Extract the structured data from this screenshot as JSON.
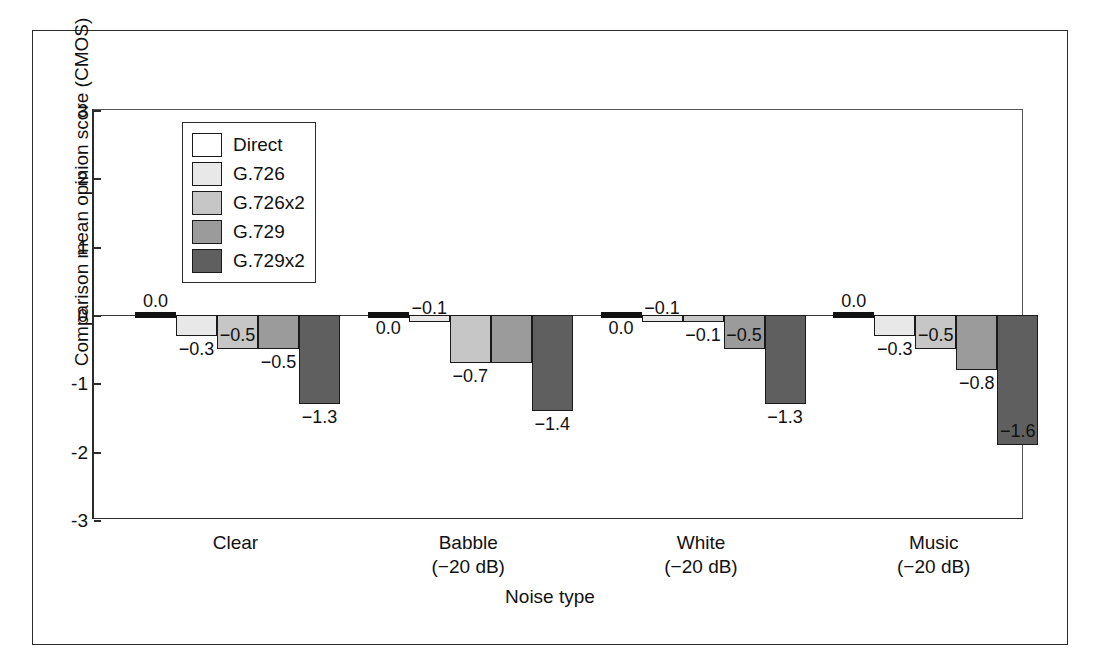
{
  "chart_data": {
    "type": "bar",
    "title": "",
    "xlabel": "Noise type",
    "ylabel": "Comparison mean opinion score (CMOS)",
    "ylim": [
      -3,
      3
    ],
    "yticks": [
      "3",
      "2",
      "1",
      "0",
      "-1",
      "-2",
      "-3"
    ],
    "ytick_values": [
      3,
      2,
      1,
      0,
      -1,
      -2,
      -3
    ],
    "grid": false,
    "legend_position": "upper-left-inside",
    "categories": [
      "Clear",
      "Babble\n(−20 dB)",
      "White\n(−20 dB)",
      "Music\n(−20 dB)"
    ],
    "category_labels": [
      {
        "line1": "Clear",
        "line2": ""
      },
      {
        "line1": "Babble",
        "line2": "(−20 dB)"
      },
      {
        "line1": "White",
        "line2": "(−20 dB)"
      },
      {
        "line1": "Music",
        "line2": "(−20 dB)"
      }
    ],
    "series": [
      {
        "name": "Direct",
        "color": "#ffffff",
        "values": [
          0.0,
          0.0,
          0.0,
          0.0
        ],
        "labels": [
          "0.0",
          "0.0",
          "0.0",
          "0.0"
        ]
      },
      {
        "name": "G.726",
        "color": "#e8e8e8",
        "values": [
          -0.3,
          -0.1,
          -0.1,
          -0.3
        ],
        "labels": [
          "−0.3",
          "−0.1",
          "−0.1",
          "−0.3"
        ]
      },
      {
        "name": "G.726x2",
        "color": "#c6c6c6",
        "values": [
          -0.5,
          -0.7,
          -0.1,
          -0.5
        ],
        "labels": [
          "−0.5",
          "−0.7",
          "−0.1",
          "−0.5"
        ]
      },
      {
        "name": "G.729",
        "color": "#9b9b9b",
        "values": [
          -0.5,
          -0.7,
          -0.5,
          -0.8
        ],
        "labels": [
          "−0.5",
          "−0.7",
          "−0.5",
          "−0.8"
        ]
      },
      {
        "name": "G.729x2",
        "color": "#5f5f5f",
        "values": [
          -1.3,
          -1.4,
          -1.3,
          -1.9
        ],
        "labels": [
          "−1.3",
          "−1.4",
          "−1.3",
          "−1.6"
        ]
      }
    ]
  },
  "legend": {
    "items": [
      {
        "label": "Direct",
        "color": "#ffffff"
      },
      {
        "label": "G.726",
        "color": "#e8e8e8"
      },
      {
        "label": "G.726x2",
        "color": "#c6c6c6"
      },
      {
        "label": "G.729",
        "color": "#9b9b9b"
      },
      {
        "label": "G.729x2",
        "color": "#5f5f5f"
      }
    ]
  },
  "value_label_layout": [
    [
      {
        "text": "0.0",
        "group": 0,
        "bar": 0,
        "pos": "above"
      },
      {
        "text": "−0.3",
        "group": 0,
        "bar": 1,
        "pos": "below"
      },
      {
        "text": "−0.5",
        "group": 0,
        "bar": 2,
        "pos": "above"
      },
      {
        "text": "−0.5",
        "group": 0,
        "bar": 3,
        "pos": "below"
      },
      {
        "text": "−1.3",
        "group": 0,
        "bar": 4,
        "pos": "below"
      }
    ],
    [
      {
        "text": "0.0",
        "group": 1,
        "bar": 0,
        "pos": "below"
      },
      {
        "text": "−0.1",
        "group": 1,
        "bar": 1,
        "pos": "above"
      },
      {
        "text": "−0.7",
        "group": 1,
        "bar": 2,
        "pos": "below"
      },
      {
        "text": "−1.4",
        "group": 1,
        "bar": 4,
        "pos": "below"
      }
    ],
    [
      {
        "text": "0.0",
        "group": 2,
        "bar": 0,
        "pos": "below"
      },
      {
        "text": "−0.1",
        "group": 2,
        "bar": 1,
        "pos": "above"
      },
      {
        "text": "−0.1",
        "group": 2,
        "bar": 2,
        "pos": "below"
      },
      {
        "text": "−0.5",
        "group": 2,
        "bar": 3,
        "pos": "above"
      },
      {
        "text": "−1.3",
        "group": 2,
        "bar": 4,
        "pos": "below"
      }
    ],
    [
      {
        "text": "0.0",
        "group": 3,
        "bar": 0,
        "pos": "above"
      },
      {
        "text": "−0.3",
        "group": 3,
        "bar": 1,
        "pos": "below"
      },
      {
        "text": "−0.5",
        "group": 3,
        "bar": 2,
        "pos": "above"
      },
      {
        "text": "−0.8",
        "group": 3,
        "bar": 3,
        "pos": "below"
      },
      {
        "text": "−1.6",
        "group": 3,
        "bar": 4,
        "pos": "above"
      }
    ]
  ]
}
